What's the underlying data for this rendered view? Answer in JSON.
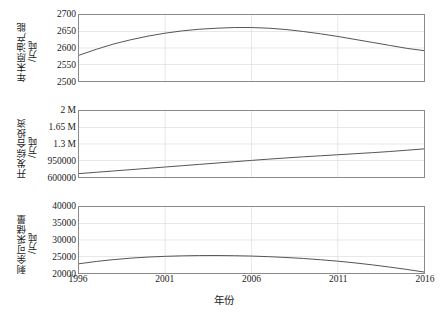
{
  "chart_data": [
    {
      "type": "line",
      "title": "",
      "ylabel": "年末原油产能",
      "yunit": "/万吨",
      "xlabel": "年份",
      "xlim": [
        1996,
        2016
      ],
      "ylim": [
        2500,
        2700
      ],
      "yticks": [
        "2500",
        "2550",
        "2600",
        "2650",
        "2700"
      ],
      "ytickvalues": [
        2500,
        2550,
        2600,
        2650,
        2700
      ],
      "xticks": [
        "1996",
        "2001",
        "2006",
        "2011",
        "2016"
      ],
      "xtickvalues": [
        1996,
        2001,
        2006,
        2011,
        2016
      ],
      "grid": true,
      "legend": "none",
      "x": [
        1996,
        1997,
        1998,
        1999,
        2000,
        2001,
        2002,
        2003,
        2004,
        2005,
        2006,
        2007,
        2008,
        2009,
        2010,
        2011,
        2012,
        2013,
        2014,
        2015,
        2016
      ],
      "values": [
        2578,
        2596,
        2612,
        2625,
        2636,
        2645,
        2652,
        2657,
        2660,
        2662,
        2662,
        2660,
        2656,
        2650,
        2643,
        2635,
        2626,
        2617,
        2608,
        2599,
        2592
      ]
    },
    {
      "type": "line",
      "title": "",
      "ylabel": "开发综合投资",
      "yunit": "/万吨",
      "xlabel": "年份",
      "xlim": [
        1996,
        2016
      ],
      "ylim": [
        600000,
        2000000
      ],
      "yticks": [
        "600000",
        "950000",
        "1.3 M",
        "1.65 M",
        "2 M"
      ],
      "ytickvalues": [
        600000,
        950000,
        1300000,
        1650000,
        2000000
      ],
      "xticks": [
        "1996",
        "2001",
        "2006",
        "2011",
        "2016"
      ],
      "xtickvalues": [
        1996,
        2001,
        2006,
        2011,
        2016
      ],
      "grid": true,
      "legend": "none",
      "x": [
        1996,
        1997,
        1998,
        1999,
        2000,
        2001,
        2002,
        2003,
        2004,
        2005,
        2006,
        2007,
        2008,
        2009,
        2010,
        2011,
        2012,
        2013,
        2014,
        2015,
        2016
      ],
      "values": [
        672000,
        700000,
        728000,
        756000,
        784000,
        812000,
        840000,
        868000,
        896000,
        924000,
        952000,
        979000,
        1004000,
        1028000,
        1050000,
        1072000,
        1094000,
        1116000,
        1140000,
        1168000,
        1196000
      ]
    },
    {
      "type": "line",
      "title": "",
      "ylabel": "剩余可采储量",
      "yunit": "/万吨",
      "xlabel": "年份",
      "xlim": [
        1996,
        2016
      ],
      "ylim": [
        20000,
        40000
      ],
      "yticks": [
        "20000",
        "25000",
        "30000",
        "35000",
        "40000"
      ],
      "ytickvalues": [
        20000,
        25000,
        30000,
        35000,
        40000
      ],
      "xticks": [
        "1996",
        "2001",
        "2006",
        "2011",
        "2016"
      ],
      "xtickvalues": [
        1996,
        2001,
        2006,
        2011,
        2016
      ],
      "grid": true,
      "legend": "none",
      "x": [
        1996,
        1997,
        1998,
        1999,
        2000,
        2001,
        2002,
        2003,
        2004,
        2005,
        2006,
        2007,
        2008,
        2009,
        2010,
        2011,
        2012,
        2013,
        2014,
        2015,
        2016
      ],
      "values": [
        22800,
        23500,
        24050,
        24500,
        24830,
        25050,
        25200,
        25280,
        25290,
        25240,
        25130,
        24950,
        24700,
        24400,
        24020,
        23580,
        23060,
        22470,
        21800,
        21080,
        20300
      ]
    }
  ],
  "style": {
    "line_color": "#555555",
    "axis_color": "#8a8a8a",
    "grid_color": "#d9d9d9",
    "background": "#ffffff",
    "text_color": "#1a1a1a"
  },
  "xaxis": {
    "title": "年份",
    "ticks": [
      "1996",
      "2001",
      "2006",
      "2011",
      "2016"
    ]
  }
}
